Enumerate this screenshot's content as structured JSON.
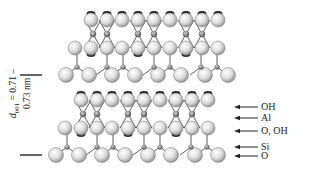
{
  "figure": {
    "spacing_label": {
      "symbol": "d",
      "subscript": "001",
      "line1": " = 0.71 –",
      "line2": "0.73 nm"
    },
    "layer_labels": [
      {
        "text": "OH",
        "y": 107
      },
      {
        "text": "Al",
        "y": 118
      },
      {
        "text": "O, OH",
        "y": 131
      },
      {
        "text": "Si",
        "y": 147
      },
      {
        "text": "O",
        "y": 156
      }
    ],
    "colors": {
      "atom_fill_light": "#f4f4f4",
      "atom_fill_dark": "#9a9a9a",
      "atom_stroke": "#6a6a6a",
      "bond": "#333333",
      "cation_fill": "#7a7a7a",
      "text": "#222222"
    }
  }
}
